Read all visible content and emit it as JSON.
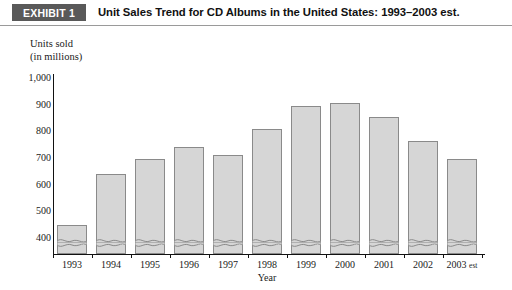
{
  "header": {
    "badge_label": "EXHIBIT 1",
    "title": "Unit Sales Trend for CD Albums in the United States: 1993–2003 est.",
    "badge_color": "#595959"
  },
  "chart_data": {
    "type": "bar",
    "title": "Unit Sales Trend for CD Albums in the United States: 1993–2003 est.",
    "xlabel": "Year",
    "ylabel": "Units sold\n(in millions)",
    "ylabel_line1": "Units sold",
    "ylabel_line2": "(in millions)",
    "categories": [
      "1993",
      "1994",
      "1995",
      "1996",
      "1997",
      "1998",
      "1999",
      "2000",
      "2001",
      "2002",
      "2003 est"
    ],
    "values": [
      495,
      685,
      740,
      785,
      755,
      855,
      940,
      950,
      900,
      810,
      740
    ],
    "ylim": [
      400,
      1000
    ],
    "yticks": [
      "400",
      "500",
      "600",
      "700",
      "800",
      "900",
      "1,000"
    ],
    "ytick_values": [
      400,
      500,
      600,
      700,
      800,
      900,
      1000
    ],
    "grid": false,
    "legend": "none",
    "axis_break": true,
    "axis_break_note": "bars broken below 400 with wavy cut",
    "bar_fill": "#d6d6d6",
    "bar_stroke": "#8a8a8a"
  }
}
